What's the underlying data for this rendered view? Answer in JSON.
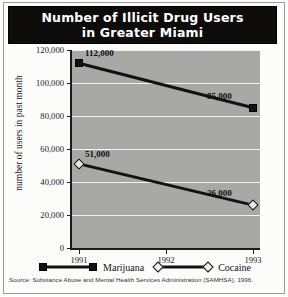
{
  "title": {
    "line1": "Number of Illicit Drug Users",
    "line2": "in Greater Miami"
  },
  "source_note": "Source: Substance Abuse and Mental Health Services Administration (SAMHSA), 1996.",
  "legend": {
    "items": [
      {
        "label": "Marijuana",
        "marker": "filled-square",
        "color": "#121212"
      },
      {
        "label": "Cocaine",
        "marker": "open-diamond",
        "color": "#121212"
      }
    ]
  },
  "axis": {
    "y_ticks": [
      "0",
      "20,000",
      "40,000",
      "60,000",
      "80,000",
      "100,000",
      "120,000"
    ],
    "x_ticks": [
      "1991",
      "1992",
      "1993"
    ]
  },
  "chart_data": {
    "type": "line",
    "title": "Number of Illicit Drug Users in Greater Miami",
    "xlabel": "",
    "ylabel": "number of users in past month",
    "x": [
      "1991",
      "1992",
      "1993"
    ],
    "categories": [
      "1991",
      "1992",
      "1993"
    ],
    "ylim": [
      0,
      120000
    ],
    "ytick_values": [
      0,
      20000,
      40000,
      60000,
      80000,
      100000,
      120000
    ],
    "grid": "horizontal",
    "legend_position": "bottom",
    "plot_background": "#a8a8a6",
    "series": [
      {
        "name": "Marijuana",
        "marker": "filled-square",
        "color": "#121212",
        "x": [
          "1991",
          "1993"
        ],
        "values": [
          112000,
          85000
        ],
        "point_labels": [
          "112,000",
          "85,000"
        ]
      },
      {
        "name": "Cocaine",
        "marker": "open-diamond",
        "color": "#121212",
        "x": [
          "1991",
          "1993"
        ],
        "values": [
          51000,
          26000
        ],
        "point_labels": [
          "51,000",
          "26,000"
        ]
      }
    ],
    "annotations": [
      {
        "text": "112,000",
        "series": "Marijuana",
        "x": "1991",
        "y": 112000
      },
      {
        "text": "85,000",
        "series": "Marijuana",
        "x": "1993",
        "y": 85000
      },
      {
        "text": "51,000",
        "series": "Cocaine",
        "x": "1991",
        "y": 51000
      },
      {
        "text": "26,000",
        "series": "Cocaine",
        "x": "1993",
        "y": 26000
      }
    ]
  }
}
